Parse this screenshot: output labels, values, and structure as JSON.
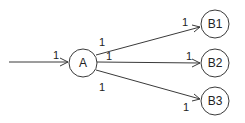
{
  "diagram": {
    "type": "directed-graph",
    "nodes": [
      {
        "id": "A",
        "label": "A"
      },
      {
        "id": "B1",
        "label": "B1"
      },
      {
        "id": "B2",
        "label": "B2"
      },
      {
        "id": "B3",
        "label": "B3"
      }
    ],
    "edges": [
      {
        "from": "input",
        "to": "A",
        "weight_label": "1"
      },
      {
        "from": "A",
        "to": "B1",
        "source_label": "1",
        "target_label": "1"
      },
      {
        "from": "A",
        "to": "B2",
        "source_label": "1",
        "target_label": "1"
      },
      {
        "from": "A",
        "to": "B3",
        "source_label": "1",
        "target_label": "1"
      }
    ]
  }
}
